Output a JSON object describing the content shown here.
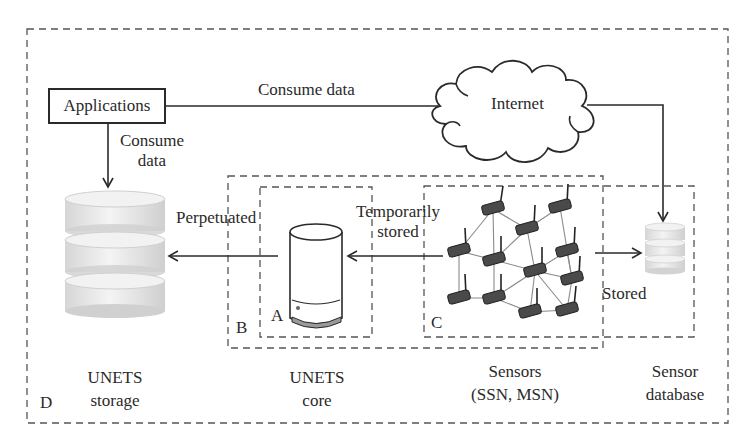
{
  "diagram": {
    "type": "architecture",
    "nodes": {
      "applications": {
        "label": "Applications"
      },
      "internet": {
        "label": "Internet"
      },
      "unets_storage": {
        "label_line1": "UNETS",
        "label_line2": "storage"
      },
      "unets_core": {
        "label_line1": "UNETS",
        "label_line2": "core"
      },
      "sensors": {
        "label_line1": "Sensors",
        "label_line2": "(SSN, MSN)"
      },
      "sensor_database": {
        "label_line1": "Sensor",
        "label_line2": "database"
      }
    },
    "edges": {
      "apps_to_internet": {
        "label": "Consume data"
      },
      "apps_to_storage": {
        "label_line1": "Consume",
        "label_line2": "data"
      },
      "core_to_storage": {
        "label": "Perpetuated"
      },
      "sensors_to_core": {
        "label_line1": "Temporarily",
        "label_line2": "stored"
      },
      "sensors_to_database": {
        "label": "Stored"
      }
    },
    "regions": {
      "A": "A",
      "B": "B",
      "C": "C",
      "D": "D"
    },
    "sensor_network": {
      "node_count": 13
    }
  }
}
